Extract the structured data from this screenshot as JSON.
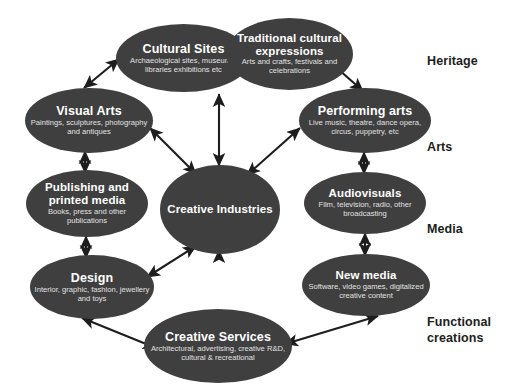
{
  "diagram": {
    "center": {
      "id": "creative-industries",
      "title": "Creative Industries",
      "subtitle": ""
    },
    "nodes": [
      {
        "id": "cultural-sites",
        "title": "Cultural Sites",
        "subtitle": "Archaeological sites, museums, libraries exhibitions etc",
        "category": "Heritage"
      },
      {
        "id": "traditional-cultural-expressions",
        "title": "Traditional cultural expressions",
        "subtitle": "Arts and crafts, festivals and celebrations",
        "category": "Heritage"
      },
      {
        "id": "visual-arts",
        "title": "Visual Arts",
        "subtitle": "Paintings, sculptures, photography and antiques",
        "category": "Arts"
      },
      {
        "id": "performing-arts",
        "title": "Performing arts",
        "subtitle": "Live music, theatre, dance opera, circus, puppetry, etc",
        "category": "Arts"
      },
      {
        "id": "publishing-and-printed-media",
        "title": "Publishing and printed media",
        "subtitle": "Books, press and other publications",
        "category": "Media"
      },
      {
        "id": "audiovisuals",
        "title": "Audiovisuals",
        "subtitle": "Film, television, radio, other broadcasting",
        "category": "Media"
      },
      {
        "id": "design",
        "title": "Design",
        "subtitle": "Interior, graphic, fashion, jewellery and toys",
        "category": "Functional creations"
      },
      {
        "id": "new-media",
        "title": "New media",
        "subtitle": "Software, video games, digitalized creative content",
        "category": "Functional creations"
      },
      {
        "id": "creative-services",
        "title": "Creative Services",
        "subtitle": "Architectural, advertising, creative R&D, cultural & recreational",
        "category": "Functional creations"
      }
    ],
    "categories": [
      {
        "id": "heritage",
        "label": "Heritage"
      },
      {
        "id": "arts",
        "label": "Arts"
      },
      {
        "id": "media",
        "label": "Media"
      },
      {
        "id": "functional-creations",
        "label": "Functional\ncreations"
      }
    ],
    "edges": [
      {
        "from": "visual-arts",
        "to": "cultural-sites",
        "style": "double-headed"
      },
      {
        "from": "cultural-sites",
        "to": "creative-industries",
        "style": "double-headed"
      },
      {
        "from": "traditional-cultural-expressions",
        "to": "performing-arts",
        "style": "double-headed"
      },
      {
        "from": "visual-arts",
        "to": "creative-industries",
        "style": "double-headed"
      },
      {
        "from": "performing-arts",
        "to": "creative-industries",
        "style": "double-headed"
      },
      {
        "from": "visual-arts",
        "to": "publishing-and-printed-media",
        "style": "double-headed"
      },
      {
        "from": "performing-arts",
        "to": "audiovisuals",
        "style": "double-headed"
      },
      {
        "from": "publishing-and-printed-media",
        "to": "design",
        "style": "double-headed"
      },
      {
        "from": "audiovisuals",
        "to": "new-media",
        "style": "double-headed"
      },
      {
        "from": "design",
        "to": "creative-industries",
        "style": "double-headed"
      },
      {
        "from": "new-media",
        "to": "creative-industries",
        "style": "double-headed"
      },
      {
        "from": "design",
        "to": "creative-services",
        "style": "double-headed"
      },
      {
        "from": "new-media",
        "to": "creative-services",
        "style": "double-headed"
      }
    ],
    "colors": {
      "node_fill": "#3f3f3f",
      "node_text": "#ffffff",
      "node_subtext": "#e2e2e2",
      "arrow": "#1d1d1d",
      "background": "#ffffff",
      "category_label": "#1d1d1d"
    }
  }
}
